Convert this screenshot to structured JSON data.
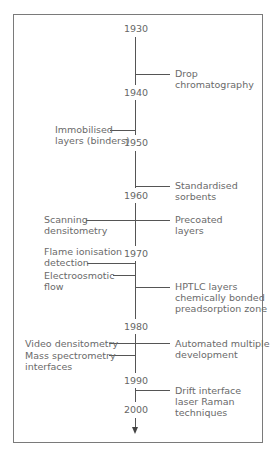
{
  "diagram": {
    "type": "timeline",
    "years": [
      "1930",
      "1940",
      "1950",
      "1960",
      "1970",
      "1980",
      "1990",
      "2000"
    ],
    "events": {
      "drop": [
        "Drop",
        "chromatography"
      ],
      "immob": [
        "Immobilised",
        "layers (binders)"
      ],
      "std": [
        "Standardised",
        "sorbents"
      ],
      "scan": [
        "Scanning",
        "densitometry"
      ],
      "precoat": [
        "Precoated",
        "layers"
      ],
      "flame": [
        "Flame ionisation",
        "detection"
      ],
      "electro": [
        "Electroosmotic",
        "flow"
      ],
      "hptlc": [
        "HPTLC layers",
        "chemically bonded",
        "preadsorption zone"
      ],
      "video": [
        "Video densitometry"
      ],
      "mass": [
        "Mass spectrometry",
        "interfaces"
      ],
      "auto": [
        "Automated multiple",
        "development"
      ],
      "drift": [
        "Drift interface",
        "laser Raman",
        "techniques"
      ]
    }
  }
}
